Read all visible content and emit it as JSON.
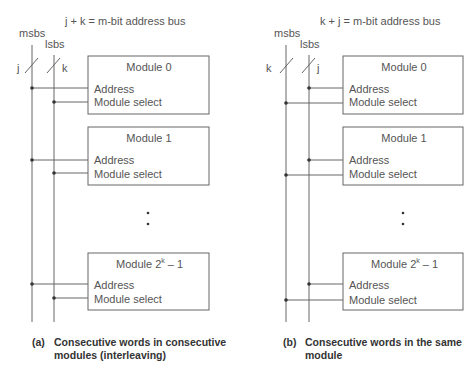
{
  "panels": [
    {
      "id": "a",
      "bus_title": "j + k = m-bit address bus",
      "msbs_label": "msbs",
      "lsbs_label": "lsbs",
      "msbs_width": "j",
      "lsbs_width": "k",
      "modules": [
        {
          "title": "Module 0",
          "address": "Address",
          "select": "Module select"
        },
        {
          "title": "Module 1",
          "address": "Address",
          "select": "Module select"
        },
        {
          "title_base": "Module 2",
          "title_sup": "k",
          "title_tail": " – 1",
          "address": "Address",
          "select": "Module select"
        }
      ],
      "caption_tag": "(a)",
      "caption_line1": "Consecutive words in consecutive",
      "caption_line2": "modules (interleaving)"
    },
    {
      "id": "b",
      "bus_title": "k + j = m-bit address bus",
      "msbs_label": "msbs",
      "lsbs_label": "lsbs",
      "msbs_width": "k",
      "lsbs_width": "j",
      "modules": [
        {
          "title": "Module 0",
          "address": "Address",
          "select": "Module select"
        },
        {
          "title": "Module 1",
          "address": "Address",
          "select": "Module select"
        },
        {
          "title_base": "Module 2",
          "title_sup": "k",
          "title_tail": " – 1",
          "address": "Address",
          "select": "Module select"
        }
      ],
      "caption_tag": "(b)",
      "caption_line1": "Consecutive words in the same",
      "caption_line2": "module"
    }
  ]
}
